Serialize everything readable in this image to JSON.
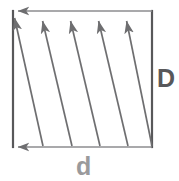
{
  "figure": {
    "title": "",
    "type": "geometric-diagram",
    "canvas": {
      "width": 179,
      "height": 181,
      "background": "#ffffff"
    },
    "colors": {
      "rect_stroke": "#58585a",
      "arrow_stroke": "#6e6e70",
      "label_D": "#58585a",
      "label_d": "#9a9a9c"
    },
    "rectangle": {
      "name": "boundary-rectangle",
      "left": 13,
      "top": 11,
      "right": 152,
      "bottom": 147,
      "stroke_width": 2.2
    },
    "labels": {
      "vertical": {
        "text": "D",
        "meaning": "vertical dimension",
        "x": 157,
        "y": 66,
        "font_size": 25
      },
      "horizontal": {
        "text": "d",
        "meaning": "horizontal dimension",
        "x": 76,
        "y": 154,
        "font_size": 25
      }
    },
    "horizontal_arrows": [
      {
        "name": "top-arrow",
        "x1": 152,
        "y1": 11,
        "x2": 13,
        "y2": 11,
        "direction": "left"
      },
      {
        "name": "bottom-arrow",
        "x1": 152,
        "y1": 147,
        "x2": 13,
        "y2": 147,
        "direction": "left"
      }
    ],
    "diagonal_arrows": {
      "count": 5,
      "direction": "up-left",
      "stroke_width": 1.6,
      "lines": [
        {
          "name": "diagonal-arrow-1",
          "x1": 43,
          "y1": 146,
          "x2": 14,
          "y2": 14
        },
        {
          "name": "diagonal-arrow-2",
          "x1": 72,
          "y1": 146,
          "x2": 42,
          "y2": 17
        },
        {
          "name": "diagonal-arrow-3",
          "x1": 100,
          "y1": 146,
          "x2": 70,
          "y2": 17
        },
        {
          "name": "diagonal-arrow-4",
          "x1": 128,
          "y1": 146,
          "x2": 98,
          "y2": 17
        },
        {
          "name": "diagonal-arrow-5",
          "x1": 152,
          "y1": 146,
          "x2": 126,
          "y2": 17
        }
      ]
    }
  }
}
